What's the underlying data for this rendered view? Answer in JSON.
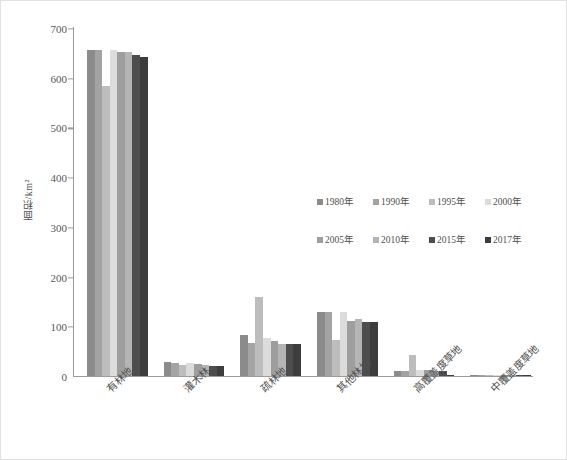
{
  "chart_data": {
    "type": "bar",
    "title": "",
    "xlabel": "",
    "ylabel": "面积/km²",
    "ylim": [
      0,
      700
    ],
    "yticks": [
      0,
      100,
      200,
      300,
      400,
      500,
      600,
      700
    ],
    "grid": false,
    "legend_position": "center-right",
    "categories": [
      "有林地",
      "灌木林",
      "疏林地",
      "其他林地",
      "高覆盖度草地",
      "中覆盖度草地"
    ],
    "series": [
      {
        "name": "1980年",
        "color": "#8b8b8b",
        "values": [
          655,
          27,
          82,
          127,
          9,
          1
        ]
      },
      {
        "name": "1990年",
        "color": "#a3a3a3",
        "values": [
          655,
          25,
          66,
          127,
          10,
          1
        ]
      },
      {
        "name": "1995年",
        "color": "#bdbdbd",
        "values": [
          583,
          22,
          158,
          72,
          42,
          1
        ]
      },
      {
        "name": "2000年",
        "color": "#dcdcdc",
        "values": [
          655,
          26,
          76,
          127,
          11,
          1
        ]
      },
      {
        "name": "2005年",
        "color": "#9e9e9e",
        "values": [
          650,
          23,
          69,
          110,
          11,
          1
        ]
      },
      {
        "name": "2010年",
        "color": "#b5b5b5",
        "values": [
          650,
          22,
          64,
          113,
          9,
          1
        ]
      },
      {
        "name": "2015年",
        "color": "#4d4d4d",
        "values": [
          645,
          19,
          63,
          107,
          10,
          1
        ]
      },
      {
        "name": "2017年",
        "color": "#3d3d3d",
        "values": [
          640,
          19,
          63,
          107,
          1,
          1
        ]
      }
    ]
  },
  "axis": {
    "y_label": "面积/km²",
    "tick_labels": [
      "0",
      "100",
      "200",
      "300",
      "400",
      "500",
      "600",
      "700"
    ]
  },
  "legend": {
    "row1": [
      "1980年",
      "1990年",
      "1995年",
      "2000年"
    ],
    "row2": [
      "2005年",
      "2010年",
      "2015年",
      "2017年"
    ]
  }
}
